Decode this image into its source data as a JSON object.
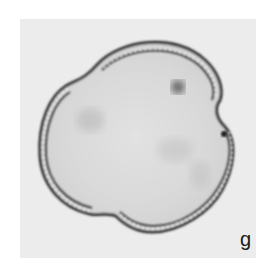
{
  "figure": {
    "panel_label": "g",
    "colors": {
      "page_background": "#ffffff",
      "photo_background": "#ececec",
      "grain_interior": "#dcdcdc",
      "wall_dark": "#2a2a2a",
      "wall_light": "#f2f2f2"
    }
  }
}
